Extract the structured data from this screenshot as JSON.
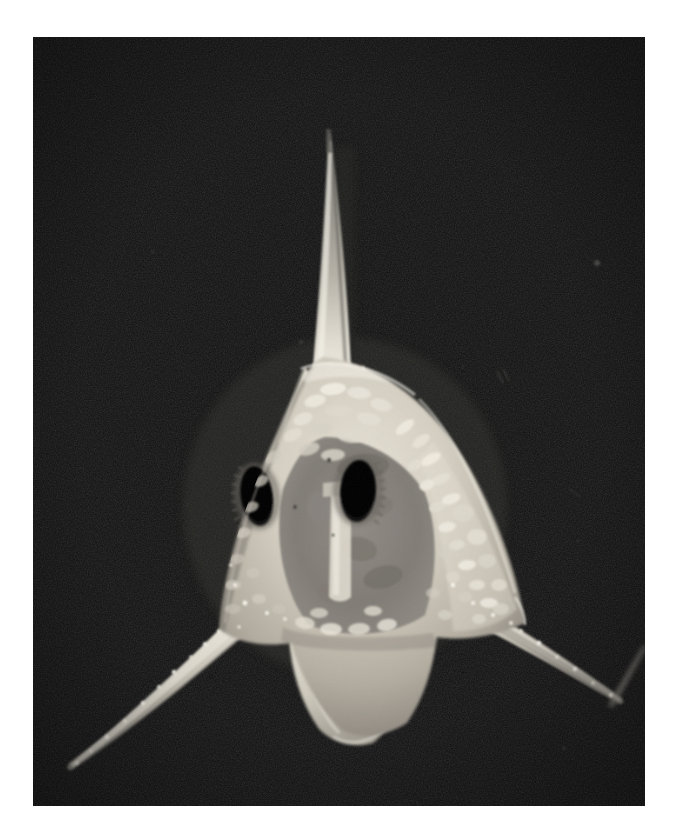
{
  "page": {
    "background_color": "#ffffff",
    "width": 673,
    "height": 828,
    "title": "Photomicrograph of crab zoea larva, frontal view"
  },
  "photo": {
    "frame": {
      "x": 33,
      "y": 37,
      "width": 612,
      "height": 769
    },
    "background_color": "#0c0c0c",
    "background_description": "uniform near-black dark-field background with fine film grain",
    "medium": "black-and-white photomicrograph / dark-field light micrograph",
    "orientation": "frontal (anterior) view, dorsal spine pointing up",
    "subject_name": "crab zoea larva",
    "dominant_colors": {
      "background": "#0c0c0c",
      "background_grain_light": "#1c1c1c",
      "specimen_highlight": "#f2efe6",
      "specimen_midtone": "#b9b4a8",
      "specimen_shadow": "#6e6a62",
      "eye_black": "#050505"
    },
    "specimen": {
      "label": "zoea-larva",
      "body": {
        "description": "rounded triangular cephalothorax (carapace) with granular papillate surface",
        "center_x": 311,
        "center_y": 500,
        "width": 300,
        "height": 300
      },
      "features": [
        {
          "name": "dorsal-spine",
          "description": "long slender tapering rostral/dorsal spine projecting vertically upward",
          "tip_x": 327,
          "tip_y": 133,
          "base_x": 323,
          "base_y": 380,
          "length_px": 247,
          "brightness": "bright, fading toward tip"
        },
        {
          "name": "left-lateral-spine",
          "description": "lower-left lateral spine, tapering, speckled with bright granules",
          "base_x": 225,
          "base_y": 620,
          "tip_x": 68,
          "tip_y": 762,
          "length_px": 212
        },
        {
          "name": "right-lateral-spine",
          "description": "lower-right lateral spine, tapering, speckled with bright granules",
          "base_x": 450,
          "base_y": 610,
          "tip_x": 632,
          "tip_y": 700,
          "length_px": 203
        },
        {
          "name": "left-compound-eye",
          "description": "large dark oval compound eye, left side of image",
          "center_x": 256,
          "center_y": 496,
          "width": 34,
          "height": 62
        },
        {
          "name": "right-compound-eye",
          "description": "large dark oval compound eye, right side of image",
          "center_x": 356,
          "center_y": 490,
          "width": 36,
          "height": 62
        },
        {
          "name": "abdomen-lobe",
          "description": "pale ventral/abdominal lobe extending below the carapace",
          "center_x": 330,
          "center_y": 680,
          "width": 120,
          "height": 110
        },
        {
          "name": "carapace-granulation",
          "description": "field of small raised oval tubercles covering the right and upper carapace"
        },
        {
          "name": "background-stray-streak",
          "description": "faint diagonal bright streak of a second specimen entering the frame at the right edge",
          "x": 615,
          "y": 665
        },
        {
          "name": "background-dust-speck",
          "description": "small isolated bright dust speck in upper-right background",
          "x": 597,
          "y": 263
        }
      ]
    }
  }
}
